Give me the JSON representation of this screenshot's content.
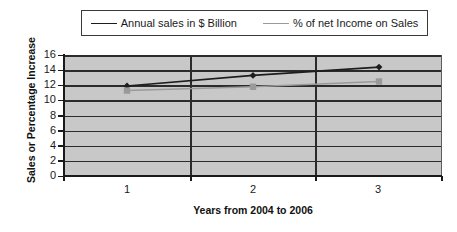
{
  "chart_data": {
    "type": "line",
    "title": "",
    "xlabel": "Years from 2004 to 2006",
    "ylabel": "Sales or Percentage Increase",
    "categories": [
      "1",
      "2",
      "3"
    ],
    "ylim": [
      0,
      16
    ],
    "ytick_step": 2,
    "yticks": [
      "16",
      "14",
      "12",
      "10",
      "8",
      "6",
      "4",
      "2",
      "0"
    ],
    "grid": true,
    "legend_position": "top",
    "series": [
      {
        "name": "Annual sales in $ Billion",
        "values": [
          11.9,
          13.3,
          14.4
        ],
        "color": "#1d1d1d",
        "marker": "diamond"
      },
      {
        "name": "% of net Income on Sales",
        "values": [
          11.3,
          11.8,
          12.5
        ],
        "color": "#9a9a9a",
        "marker": "square"
      }
    ]
  },
  "legend": {
    "entries": [
      {
        "label": "Annual sales in $ Billion",
        "marker": "diamond-marker-icon"
      },
      {
        "label": "% of net Income on Sales",
        "marker": "square-marker-icon"
      }
    ]
  },
  "axes": {
    "y_title": "Sales or Percentage Increase",
    "x_title": "Years from 2004 to 2006",
    "y_tick_labels": [
      "16",
      "14",
      "12",
      "10",
      "8",
      "6",
      "4",
      "2",
      "0"
    ],
    "x_tick_labels": [
      "1",
      "2",
      "3"
    ]
  },
  "colors": {
    "plot_background": "#c8c8c8",
    "gridline": "#2b2b2b",
    "series_1": "#1d1d1d",
    "series_2": "#9a9a9a",
    "page_background": "#ffffff"
  }
}
